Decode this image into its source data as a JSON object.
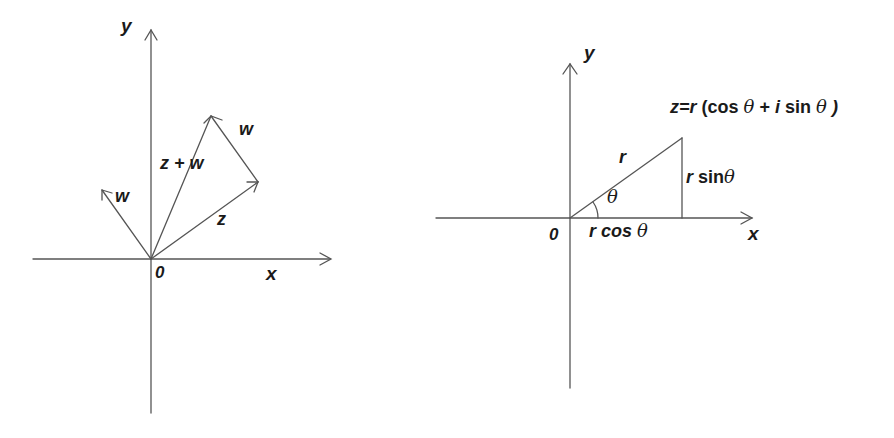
{
  "colors": {
    "line": "#555555",
    "text": "#1a1a1a",
    "background": "#ffffff"
  },
  "left_diagram": {
    "title": "Vector addition of complex numbers",
    "axis_x_label": "x",
    "axis_y_label": "y",
    "origin_label": "0",
    "vectors": [
      {
        "name": "w",
        "label": "w",
        "from": [
          0,
          0
        ],
        "to": [
          -49,
          69
        ]
      },
      {
        "name": "z",
        "label": "z",
        "from": [
          0,
          0
        ],
        "to": [
          107,
          77
        ]
      },
      {
        "name": "z_plus_w",
        "label": "z + w",
        "from": [
          0,
          0
        ],
        "to": [
          60,
          143
        ]
      },
      {
        "name": "w_translated",
        "label": "w",
        "from": [
          107,
          77
        ],
        "to": [
          60,
          143
        ]
      }
    ]
  },
  "right_diagram": {
    "title": "Polar form of a complex number",
    "axis_x_label": "x",
    "axis_y_label": "y",
    "origin_label": "0",
    "hypotenuse_label": "r",
    "angle_label": "θ",
    "opposite_label_r": "r",
    "opposite_label_fn": "sin",
    "opposite_label_theta": "θ",
    "adjacent_label_r": "r",
    "adjacent_label_fn": "cos",
    "adjacent_label_theta": "θ",
    "point_formula": {
      "lhs": "z=r",
      "open": "(cos",
      "theta1": "θ",
      "plus": "+",
      "i": "i",
      "sin": "sin",
      "theta2": "θ",
      "close": ")"
    }
  }
}
